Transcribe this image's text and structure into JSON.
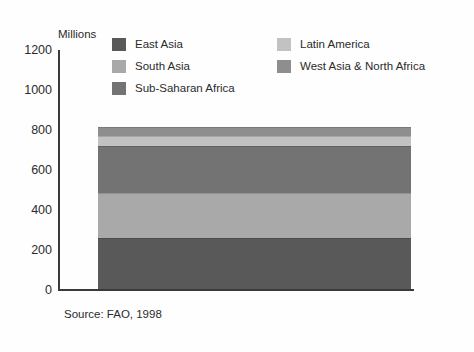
{
  "axis_title": "Millions",
  "source_note": "Source: FAO, 1998",
  "legend": {
    "left_items": [
      {
        "label": "East Asia",
        "color": "#595959",
        "swatch_name": "legend-swatch-east-asia"
      },
      {
        "label": "South Asia",
        "color": "#a9a9a9",
        "swatch_name": "legend-swatch-south-asia"
      },
      {
        "label": "Sub-Saharan Africa",
        "color": "#737373",
        "swatch_name": "legend-swatch-sub-saharan-africa"
      }
    ],
    "right_items": [
      {
        "label": "Latin America",
        "color": "#c2c2c2",
        "swatch_name": "legend-swatch-latin-america"
      },
      {
        "label": "West Asia & North Africa",
        "color": "#8e8e8e",
        "swatch_name": "legend-swatch-west-asia-north-africa"
      }
    ]
  },
  "chart_data": {
    "type": "bar",
    "title": "",
    "subtitle": "",
    "xlabel": "",
    "ylabel": "Millions",
    "ylim": [
      0,
      1200
    ],
    "yticks": [
      0,
      200,
      400,
      600,
      800,
      1000,
      1200
    ],
    "ytick_labels": [
      "0",
      "200",
      "400",
      "600",
      "800",
      "1000",
      "1200"
    ],
    "grid": false,
    "legend_position": "top",
    "stacked": true,
    "categories": [
      "Undernourished population"
    ],
    "series": [
      {
        "name": "East Asia",
        "values": [
          255
        ],
        "color": "#595959"
      },
      {
        "name": "South Asia",
        "values": [
          225
        ],
        "color": "#a9a9a9"
      },
      {
        "name": "Sub-Saharan Africa",
        "values": [
          235
        ],
        "color": "#737373"
      },
      {
        "name": "Latin America",
        "values": [
          50
        ],
        "color": "#c2c2c2"
      },
      {
        "name": "West Asia & North Africa",
        "values": [
          45
        ],
        "color": "#8e8e8e"
      }
    ],
    "total": 810,
    "source": "Source: FAO, 1998"
  }
}
